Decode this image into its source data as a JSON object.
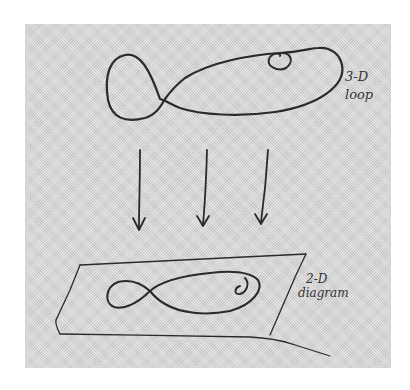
{
  "figure": {
    "top_label": {
      "line1": "3-D",
      "line2": "loop"
    },
    "bottom_label": {
      "line1": "2-D",
      "line2": "diagram"
    },
    "arrows": [
      {
        "name": "projection-arrow-left"
      },
      {
        "name": "projection-arrow-middle"
      },
      {
        "name": "projection-arrow-right"
      }
    ],
    "colors": {
      "paper": "#d6d6d6",
      "ink": "#2a2a2a",
      "background": "#ffffff"
    }
  }
}
